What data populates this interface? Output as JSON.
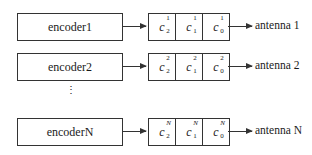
{
  "rows": [
    {
      "encoder": "encoder1",
      "cells": [
        {
          "base": "c",
          "sub": "2",
          "sup": "1"
        },
        {
          "base": "c",
          "sub": "1",
          "sup": "1"
        },
        {
          "base": "c",
          "sub": "0",
          "sup": "1"
        }
      ],
      "antenna": "antenna 1"
    },
    {
      "encoder": "encoder2",
      "cells": [
        {
          "base": "c",
          "sub": "2",
          "sup": "2"
        },
        {
          "base": "c",
          "sub": "1",
          "sup": "2"
        },
        {
          "base": "c",
          "sub": "0",
          "sup": "2"
        }
      ],
      "antenna": "antenna 2"
    },
    {
      "encoder": "encoderN",
      "cells": [
        {
          "base": "c",
          "sub": "2",
          "sup": "N"
        },
        {
          "base": "c",
          "sub": "1",
          "sup": "N"
        },
        {
          "base": "c",
          "sub": "0",
          "sup": "N"
        }
      ],
      "antenna": "antenna N"
    }
  ],
  "ellipsis": "⋮"
}
